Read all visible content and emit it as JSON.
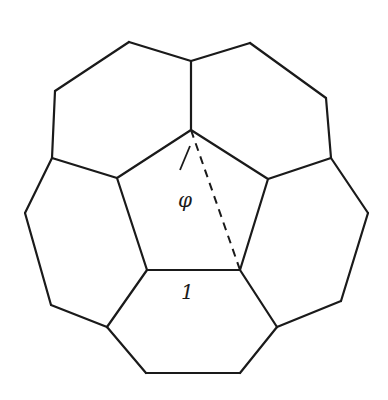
{
  "diagram": {
    "colors": {
      "line": "#1a1a1a",
      "background": "#ffffff"
    },
    "labels": {
      "diagonal": "φ",
      "edge": "1"
    },
    "central_pentagon": [
      [
        191,
        130
      ],
      [
        268,
        179
      ],
      [
        240,
        270
      ],
      [
        147,
        270
      ],
      [
        117,
        178
      ]
    ],
    "edges": [
      [
        [
          191,
          130
        ],
        [
          191,
          61
        ]
      ],
      [
        [
          191,
          61
        ],
        [
          129,
          42
        ]
      ],
      [
        [
          129,
          42
        ],
        [
          55,
          91
        ]
      ],
      [
        [
          55,
          91
        ],
        [
          52,
          158
        ]
      ],
      [
        [
          52,
          158
        ],
        [
          117,
          178
        ]
      ],
      [
        [
          191,
          61
        ],
        [
          250,
          43
        ]
      ],
      [
        [
          250,
          43
        ],
        [
          326,
          98
        ]
      ],
      [
        [
          326,
          98
        ],
        [
          331,
          158
        ]
      ],
      [
        [
          331,
          158
        ],
        [
          268,
          179
        ]
      ],
      [
        [
          52,
          158
        ],
        [
          25,
          213
        ]
      ],
      [
        [
          25,
          213
        ],
        [
          51,
          305
        ]
      ],
      [
        [
          51,
          305
        ],
        [
          107,
          327
        ]
      ],
      [
        [
          107,
          327
        ],
        [
          147,
          270
        ]
      ],
      [
        [
          331,
          158
        ],
        [
          368,
          213
        ]
      ],
      [
        [
          368,
          213
        ],
        [
          341,
          301
        ]
      ],
      [
        [
          341,
          301
        ],
        [
          277,
          327
        ]
      ],
      [
        [
          277,
          327
        ],
        [
          240,
          270
        ]
      ],
      [
        [
          107,
          327
        ],
        [
          146,
          373
        ]
      ],
      [
        [
          146,
          373
        ],
        [
          240,
          373
        ]
      ],
      [
        [
          240,
          373
        ],
        [
          277,
          327
        ]
      ]
    ],
    "dashed": [
      [
        191,
        130
      ],
      [
        240,
        270
      ]
    ]
  }
}
